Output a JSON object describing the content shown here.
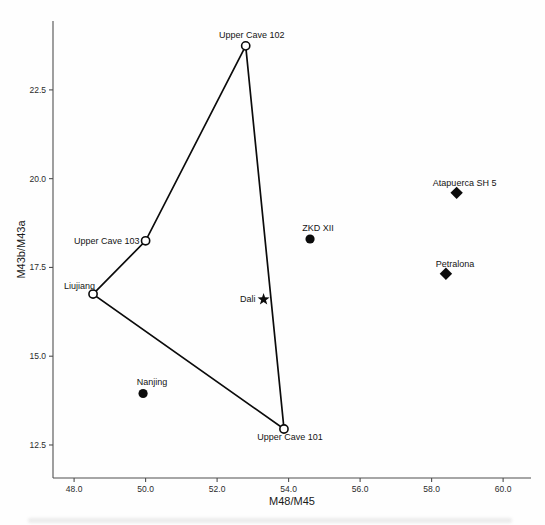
{
  "figure": {
    "background": "#fefefe"
  },
  "chart_data": {
    "type": "scatter",
    "title": "",
    "xlabel": "M48/M45",
    "ylabel": "M43b/M43a",
    "xlim": [
      47.41,
      60.78
    ],
    "ylim": [
      11.57,
      24.44
    ],
    "grid": false,
    "legend_position": "none",
    "x_ticks": [
      {
        "value": 48.0,
        "label": "48.0"
      },
      {
        "value": 50.0,
        "label": "50.0"
      },
      {
        "value": 52.0,
        "label": "52.0"
      },
      {
        "value": 54.0,
        "label": "54.0"
      },
      {
        "value": 56.0,
        "label": "56.0"
      },
      {
        "value": 58.0,
        "label": "58.0"
      },
      {
        "value": 60.0,
        "label": "60.0"
      }
    ],
    "y_ticks": [
      {
        "value": 12.5,
        "label": "12.5"
      },
      {
        "value": 15.0,
        "label": "15.0"
      },
      {
        "value": 17.5,
        "label": "17.5"
      },
      {
        "value": 20.0,
        "label": "20.0"
      },
      {
        "value": 22.5,
        "label": "22.5"
      }
    ],
    "colors": {
      "axis": "#4f4f4f",
      "text": "#1c1c1c",
      "marker": "#0b0b0b",
      "hull": "#0b0b0b"
    },
    "series": [
      {
        "name": "open-circle-group",
        "marker": "open-circle",
        "points": [
          {
            "label": "Upper Cave 102",
            "x": 52.8,
            "y": 23.74,
            "label_anchor": "middle",
            "label_dx": 6,
            "label_dy": -8
          },
          {
            "label": "Upper Cave 103",
            "x": 50.0,
            "y": 18.25,
            "label_anchor": "end",
            "label_dx": -6,
            "label_dy": 3
          },
          {
            "label": "Liujiang",
            "x": 48.53,
            "y": 16.75,
            "label_anchor": "end",
            "label_dx": 2,
            "label_dy": -5
          },
          {
            "label": "Upper Cave 101",
            "x": 53.87,
            "y": 12.95,
            "label_anchor": "middle",
            "label_dx": 6,
            "label_dy": 11
          }
        ]
      },
      {
        "name": "filled-circle-group",
        "marker": "filled-circle",
        "points": [
          {
            "label": "ZKD XII",
            "x": 54.6,
            "y": 18.3,
            "label_anchor": "middle",
            "label_dx": 8,
            "label_dy": -8
          },
          {
            "label": "Nanjing",
            "x": 49.93,
            "y": 13.95,
            "label_anchor": "middle",
            "label_dx": 9,
            "label_dy": -8
          }
        ]
      },
      {
        "name": "star-group",
        "marker": "star",
        "points": [
          {
            "label": "Dali",
            "x": 53.3,
            "y": 16.6,
            "label_anchor": "end",
            "label_dx": -8,
            "label_dy": 3
          }
        ]
      },
      {
        "name": "filled-diamond-group",
        "marker": "filled-diamond",
        "points": [
          {
            "label": "Atapuerca SH 5",
            "x": 58.7,
            "y": 19.6,
            "label_anchor": "middle",
            "label_dx": 8,
            "label_dy": -7
          },
          {
            "label": "Petralona",
            "x": 58.4,
            "y": 17.32,
            "label_anchor": "middle",
            "label_dx": 9,
            "label_dy": -7
          }
        ]
      }
    ],
    "hull": {
      "series": "open-circle-group",
      "points": [
        "Upper Cave 102",
        "Upper Cave 103",
        "Liujiang",
        "Upper Cave 101"
      ],
      "closed": true
    }
  }
}
